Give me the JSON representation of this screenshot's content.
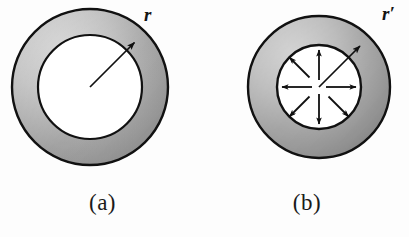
{
  "figure": {
    "background_color": "#fdfdfd",
    "width": 409,
    "height": 237
  },
  "colors": {
    "ring_light": "#c9c9c9",
    "ring_mid": "#a6a6a6",
    "ring_dark": "#838383",
    "outline": "#111111",
    "hole_fill": "#ffffff",
    "arrow": "#101010",
    "text": "#1a1a1a"
  },
  "panels": [
    {
      "id": "a",
      "caption": "(a)",
      "radius_label": "r",
      "center": {
        "x": 90,
        "y": 87
      },
      "outer_radius": 78,
      "inner_radius": 52,
      "radius_arrow": {
        "angle_deg": 45,
        "from_center": true,
        "length": 64
      },
      "field_arrows": []
    },
    {
      "id": "b",
      "caption": "(b)",
      "radius_label": "r′",
      "center": {
        "x": 114,
        "y": 87
      },
      "outer_radius": 71,
      "inner_radius": 42,
      "radius_arrow": {
        "angle_deg": 45,
        "from_center": true,
        "length": 58
      },
      "field_arrows": [
        {
          "angle_deg": 90,
          "label": "up"
        },
        {
          "angle_deg": 45,
          "label": "up-right"
        },
        {
          "angle_deg": 0,
          "label": "right"
        },
        {
          "angle_deg": 315,
          "label": "down-right"
        },
        {
          "angle_deg": 270,
          "label": "down"
        },
        {
          "angle_deg": 225,
          "label": "down-left"
        },
        {
          "angle_deg": 180,
          "label": "left"
        },
        {
          "angle_deg": 135,
          "label": "up-left"
        }
      ]
    }
  ]
}
